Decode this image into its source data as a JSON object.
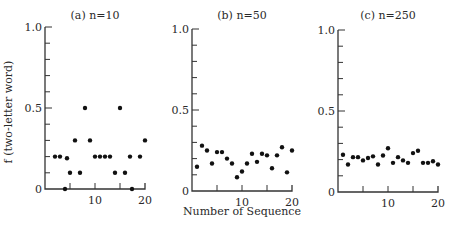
{
  "chart_data": [
    {
      "type": "scatter",
      "title": "(a) n=10",
      "xlabel": "",
      "ylabel": "f (two-letter word)",
      "xlim": [
        0,
        20
      ],
      "ylim": [
        0,
        1.0
      ],
      "yticks": [
        "0",
        "0.5",
        "1.0"
      ],
      "xticks": [
        "10",
        "20"
      ],
      "grid": false,
      "points": [
        {
          "x": 2,
          "y": 0.2
        },
        {
          "x": 3,
          "y": 0.2
        },
        {
          "x": 4,
          "y": 0.0
        },
        {
          "x": 4.4,
          "y": 0.19
        },
        {
          "x": 5,
          "y": 0.1
        },
        {
          "x": 6,
          "y": 0.3
        },
        {
          "x": 7,
          "y": 0.1
        },
        {
          "x": 8,
          "y": 0.5
        },
        {
          "x": 9,
          "y": 0.3
        },
        {
          "x": 10,
          "y": 0.2
        },
        {
          "x": 11,
          "y": 0.2
        },
        {
          "x": 12,
          "y": 0.2
        },
        {
          "x": 13,
          "y": 0.2
        },
        {
          "x": 14,
          "y": 0.1
        },
        {
          "x": 15,
          "y": 0.5
        },
        {
          "x": 16,
          "y": 0.1
        },
        {
          "x": 17,
          "y": 0.2
        },
        {
          "x": 17.4,
          "y": 0.0
        },
        {
          "x": 19,
          "y": 0.2
        },
        {
          "x": 20,
          "y": 0.3
        }
      ]
    },
    {
      "type": "scatter",
      "title": "(b) n=50",
      "xlabel": "Number of Sequence",
      "ylabel": "",
      "xlim": [
        0,
        20
      ],
      "ylim": [
        0,
        1.0
      ],
      "yticks": [
        "0",
        "0.5",
        "1.0"
      ],
      "xticks": [
        "10",
        "20"
      ],
      "grid": false,
      "points": [
        {
          "x": 1,
          "y": 0.15
        },
        {
          "x": 2,
          "y": 0.28
        },
        {
          "x": 3,
          "y": 0.25
        },
        {
          "x": 4,
          "y": 0.17
        },
        {
          "x": 5,
          "y": 0.24
        },
        {
          "x": 6,
          "y": 0.24
        },
        {
          "x": 7,
          "y": 0.2
        },
        {
          "x": 8,
          "y": 0.17
        },
        {
          "x": 9,
          "y": 0.085
        },
        {
          "x": 10,
          "y": 0.12
        },
        {
          "x": 11,
          "y": 0.17
        },
        {
          "x": 12,
          "y": 0.23
        },
        {
          "x": 13,
          "y": 0.18
        },
        {
          "x": 14,
          "y": 0.23
        },
        {
          "x": 15,
          "y": 0.22
        },
        {
          "x": 16,
          "y": 0.14
        },
        {
          "x": 17,
          "y": 0.22
        },
        {
          "x": 18,
          "y": 0.27
        },
        {
          "x": 19,
          "y": 0.115
        },
        {
          "x": 20,
          "y": 0.25
        }
      ]
    },
    {
      "type": "scatter",
      "title": "(c) n=250",
      "xlabel": "",
      "ylabel": "",
      "xlim": [
        0,
        20
      ],
      "ylim": [
        0,
        1.0
      ],
      "yticks": [
        "0",
        "0.5",
        "1.0"
      ],
      "xticks": [
        "10",
        "20"
      ],
      "grid": false,
      "points": [
        {
          "x": 1,
          "y": 0.23
        },
        {
          "x": 2,
          "y": 0.17
        },
        {
          "x": 3,
          "y": 0.215
        },
        {
          "x": 4,
          "y": 0.215
        },
        {
          "x": 5,
          "y": 0.195
        },
        {
          "x": 6,
          "y": 0.21
        },
        {
          "x": 7,
          "y": 0.22
        },
        {
          "x": 8,
          "y": 0.17
        },
        {
          "x": 9,
          "y": 0.225
        },
        {
          "x": 10,
          "y": 0.27
        },
        {
          "x": 11,
          "y": 0.18
        },
        {
          "x": 12,
          "y": 0.215
        },
        {
          "x": 13,
          "y": 0.195
        },
        {
          "x": 14,
          "y": 0.18
        },
        {
          "x": 15,
          "y": 0.24
        },
        {
          "x": 16,
          "y": 0.255
        },
        {
          "x": 17,
          "y": 0.18
        },
        {
          "x": 18,
          "y": 0.18
        },
        {
          "x": 19,
          "y": 0.19
        },
        {
          "x": 20,
          "y": 0.17
        }
      ]
    }
  ],
  "figure": {
    "ylabel": "f (two-letter word)",
    "xlabel": "Number of Sequence",
    "panels": [
      {
        "title": "(a) n=10",
        "left": 45,
        "right": 145,
        "top": 27,
        "bottom": 189
      },
      {
        "title": "(b) n=50",
        "left": 192,
        "right": 292,
        "top": 29,
        "bottom": 191
      },
      {
        "title": "(c) n=250",
        "left": 338,
        "right": 438,
        "top": 30,
        "bottom": 192
      }
    ],
    "ytick_labels": {
      "top": "1.0",
      "mid": "0.5",
      "bottom": "0"
    },
    "xtick_labels": {
      "mid": "10",
      "end": "20"
    }
  }
}
